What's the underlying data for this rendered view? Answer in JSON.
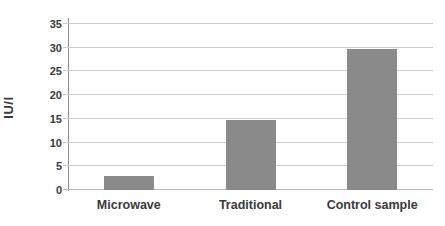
{
  "chart_data": {
    "type": "bar",
    "categories": [
      "Microwave",
      "Traditional",
      "Control sample"
    ],
    "values": [
      3,
      14.8,
      29.8
    ],
    "title": "",
    "xlabel": "",
    "ylabel": "IU/l",
    "ylim": [
      0,
      35
    ],
    "yticks": [
      0,
      5,
      10,
      15,
      20,
      25,
      30,
      35
    ],
    "grid": true,
    "legend_position": "none",
    "bar_color": "#8a8a8a",
    "gridline_color": "#cbcbcb",
    "axis_color": "#8f8f8f",
    "text_color": "#3a3a3a"
  }
}
